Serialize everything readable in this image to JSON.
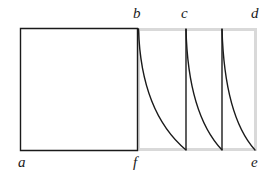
{
  "figure": {
    "kind": "geometry-diagram",
    "width": 273,
    "height": 177,
    "background_color": "#ffffff",
    "stroke_color": "#1a1a1a",
    "gray_stroke_color": "#d9d9d9"
  },
  "labels": {
    "a": "a",
    "b": "b",
    "c": "c",
    "d": "d",
    "e": "e",
    "f": "f"
  },
  "shapes": {
    "left_rectangle": {
      "name": "square-abfa",
      "x": 20,
      "y": 28,
      "width": 117,
      "height": 122,
      "stroke": "#1a1a1a",
      "stroke_width": 1.4,
      "fill": "none",
      "corner_labels": [
        "a",
        "b",
        "f"
      ]
    },
    "right_rectangle": {
      "name": "square-bdef",
      "x": 137,
      "y": 28,
      "width": 119,
      "height": 122,
      "stroke": "#d9d9d9",
      "stroke_width": 3,
      "fill": "none",
      "corner_labels": [
        "b",
        "d",
        "e",
        "f"
      ]
    },
    "arcs": [
      {
        "name": "arc-1",
        "start": [
          138,
          29
        ],
        "end": [
          186,
          150
        ],
        "control": [
          140,
          110
        ]
      },
      {
        "name": "arc-2",
        "start": [
          186,
          29
        ],
        "end": [
          222,
          150
        ],
        "control": [
          188,
          112
        ]
      },
      {
        "name": "arc-3",
        "start": [
          222,
          29
        ],
        "end": [
          255,
          150
        ],
        "control": [
          224,
          114
        ]
      }
    ],
    "vertical_lines": [
      {
        "name": "vline-1",
        "x": 186,
        "y1": 29,
        "y2": 150
      },
      {
        "name": "vline-2",
        "x": 222,
        "y1": 29,
        "y2": 150
      }
    ]
  },
  "label_positions": {
    "a": {
      "x": 18,
      "y": 155
    },
    "b": {
      "x": 133,
      "y": 6
    },
    "c": {
      "x": 181,
      "y": 6
    },
    "d": {
      "x": 251,
      "y": 6
    },
    "e": {
      "x": 251,
      "y": 155
    },
    "f": {
      "x": 133,
      "y": 155
    }
  }
}
